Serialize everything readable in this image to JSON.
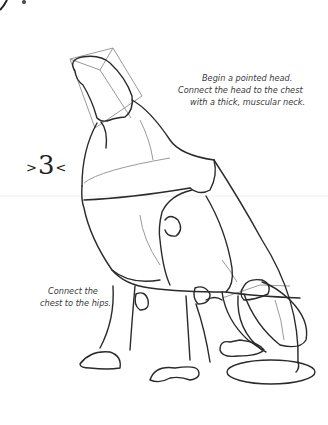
{
  "page": {
    "step_number": "3",
    "step_left_mark": ">",
    "step_right_mark": "<",
    "captions": {
      "head": [
        "Begin a pointed head.",
        "Connect the head to the chest",
        "with a thick, muscular neck."
      ],
      "hips": [
        "Connect the",
        "chest to the hips."
      ]
    },
    "colors": {
      "ink": "#2a2a2a",
      "guide": "#9a9a9a",
      "text": "#3a3a3a"
    }
  }
}
